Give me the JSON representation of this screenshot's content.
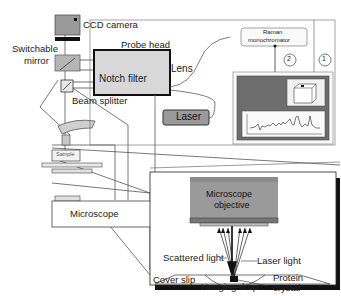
{
  "labels": {
    "ccd_camera": "CCD camera",
    "probe_head": "Probe head",
    "switchable_mirror_1": "Switchable",
    "switchable_mirror_2": "mirror",
    "notch_filter": "Notch filter",
    "lens": "Lens",
    "beam_splitter": "Beam splitter",
    "laser": "Laser",
    "raman_1": "Raman",
    "raman_2": "monochromator",
    "marker_1": "1",
    "marker_2": "2",
    "sample": "Sample",
    "microscope": "Microscope",
    "objective_1": "Microscope",
    "objective_2": "objective",
    "scattered_light": "Scattered light",
    "laser_light": "Laser light",
    "cover_slip": "Cover slip",
    "hanging_drop": "Hanging drop",
    "protein_1": "Protein",
    "protein_2": "crystal"
  },
  "colors": {
    "box_gray": "#9a9a9a",
    "light_gray": "#d8d8d8",
    "dark_gray": "#6e6e6e",
    "line": "#333333"
  }
}
